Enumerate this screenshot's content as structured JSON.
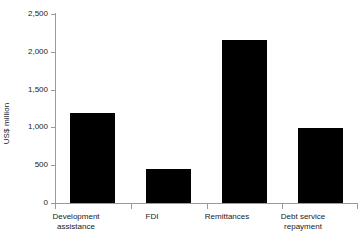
{
  "chart_data": {
    "type": "bar",
    "title": "",
    "xlabel": "",
    "ylabel": "US$ million",
    "ylim": [
      0,
      2500
    ],
    "grid": false,
    "legend": false,
    "categories": [
      "Development assistance",
      "FDI",
      "Remittances",
      "Debt service repayment"
    ],
    "values": [
      1190,
      450,
      2160,
      990
    ],
    "ytick_labels": [
      "2,500",
      "2,000",
      "1,500",
      "1,000",
      "500",
      "0"
    ],
    "ytick_values": [
      2500,
      2000,
      1500,
      1000,
      500,
      0
    ],
    "series": [
      {
        "name": "US$ million",
        "values": [
          1190,
          450,
          2160,
          990
        ]
      }
    ]
  },
  "axes": {
    "y_title": "US$ million",
    "ticks": [
      {
        "label": "2,500",
        "value": 2500
      },
      {
        "label": "2,000",
        "value": 2000
      },
      {
        "label": "1,500",
        "value": 1500
      },
      {
        "label": "1,000",
        "value": 1000
      },
      {
        "label": "500",
        "value": 500
      },
      {
        "label": "0",
        "value": 0
      }
    ]
  },
  "categories": [
    {
      "line1": "Development",
      "line2": "assistance",
      "value": 1190
    },
    {
      "line1": "FDI",
      "line2": "",
      "value": 450
    },
    {
      "line1": "Remittances",
      "line2": "",
      "value": 2160
    },
    {
      "line1": "Debt service",
      "line2": "repayment",
      "value": 990
    }
  ],
  "colors": {
    "bar": "#000000",
    "axis": "#9a9a9a",
    "text": "#1a1a1a",
    "background": "#ffffff"
  }
}
